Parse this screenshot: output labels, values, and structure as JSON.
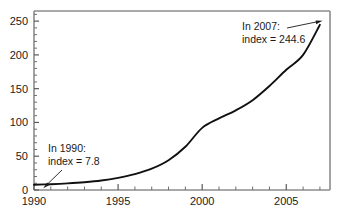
{
  "chart_data": {
    "type": "line",
    "title": "",
    "subtitle": "",
    "xlabel": "",
    "ylabel": "",
    "xlim": [
      1990,
      2007.6
    ],
    "ylim": [
      0,
      265
    ],
    "grid": false,
    "legend": null,
    "x_ticks_major": [
      1990,
      1995,
      2000,
      2005
    ],
    "x_tick_labels": [
      "1990",
      "1995",
      "2000",
      "2005"
    ],
    "x_minor_tick_interval": 1,
    "y_ticks_major": [
      0,
      50,
      100,
      150,
      200,
      250
    ],
    "y_tick_labels": [
      "0",
      "50",
      "100",
      "150",
      "200",
      "250"
    ],
    "y_minor_tick_interval": 10,
    "series": [
      {
        "name": "index",
        "x": [
          1990,
          1991,
          1992,
          1993,
          1994,
          1995,
          1996,
          1997,
          1998,
          1999,
          2000,
          2001,
          2002,
          2003,
          2004,
          2005,
          2006,
          2007
        ],
        "values": [
          7.8,
          8.6,
          9.8,
          11.5,
          14.0,
          18.0,
          23.5,
          31.5,
          44.0,
          64.0,
          92.0,
          106.0,
          118.0,
          133.0,
          154.0,
          178.0,
          200.0,
          244.6
        ]
      }
    ],
    "annotations": [
      {
        "name": "annotation-1990",
        "line1": "In 1990:",
        "line2": "index = 7.8",
        "point_x": 1990,
        "point_y": 7.8
      },
      {
        "name": "annotation-2007",
        "line1": "In 2007:",
        "line2": "index = 244.6",
        "point_x": 2007,
        "point_y": 244.6
      }
    ],
    "colors": {
      "curve": "#101010",
      "axis": "#8c8c8c",
      "tick": "#5a5a5a",
      "text": "#1a1a1a",
      "background": "#ffffff"
    }
  }
}
